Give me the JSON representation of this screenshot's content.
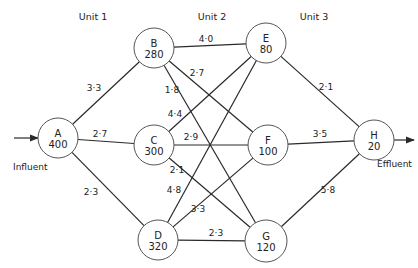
{
  "units": [
    {
      "label": "Unit 1",
      "x": 93,
      "y": 20
    },
    {
      "label": "Unit 2",
      "x": 212,
      "y": 20
    },
    {
      "label": "Unit 3",
      "x": 314,
      "y": 20
    }
  ],
  "nodes": [
    {
      "id": "A",
      "value": "400",
      "x": 58,
      "y": 138,
      "r": 20
    },
    {
      "id": "B",
      "value": "280",
      "x": 154,
      "y": 48,
      "r": 20
    },
    {
      "id": "C",
      "value": "300",
      "x": 154,
      "y": 145,
      "r": 20
    },
    {
      "id": "D",
      "value": "320",
      "x": 158,
      "y": 240,
      "r": 20
    },
    {
      "id": "E",
      "value": "80",
      "x": 266,
      "y": 43,
      "r": 20
    },
    {
      "id": "F",
      "value": "100",
      "x": 268,
      "y": 145,
      "r": 20
    },
    {
      "id": "G",
      "value": "120",
      "x": 266,
      "y": 241,
      "r": 21
    },
    {
      "id": "H",
      "value": "20",
      "x": 374,
      "y": 140,
      "r": 20
    }
  ],
  "edges": [
    {
      "from": "A",
      "to": "B",
      "label": "3·3",
      "lx": 94,
      "ly": 91
    },
    {
      "from": "A",
      "to": "C",
      "label": "2·7",
      "lx": 100,
      "ly": 137
    },
    {
      "from": "A",
      "to": "D",
      "label": "2·3",
      "lx": 91,
      "ly": 195
    },
    {
      "from": "B",
      "to": "E",
      "label": "4·0",
      "lx": 206,
      "ly": 42
    },
    {
      "from": "B",
      "to": "F",
      "label": "2·7",
      "lx": 197,
      "ly": 76
    },
    {
      "from": "B",
      "to": "G",
      "label": "1·8",
      "lx": 172,
      "ly": 93
    },
    {
      "from": "C",
      "to": "E",
      "label": "4·4",
      "lx": 175,
      "ly": 117
    },
    {
      "from": "C",
      "to": "F",
      "label": "2·9",
      "lx": 191,
      "ly": 140
    },
    {
      "from": "C",
      "to": "G",
      "label": "2·1",
      "lx": 177,
      "ly": 173
    },
    {
      "from": "D",
      "to": "E",
      "label": "4·8",
      "lx": 174,
      "ly": 193
    },
    {
      "from": "D",
      "to": "F",
      "label": "3·3",
      "lx": 198,
      "ly": 212
    },
    {
      "from": "D",
      "to": "G",
      "label": "2·3",
      "lx": 216,
      "ly": 236
    },
    {
      "from": "E",
      "to": "H",
      "label": "2·1",
      "lx": 326,
      "ly": 90
    },
    {
      "from": "F",
      "to": "H",
      "label": "3·5",
      "lx": 320,
      "ly": 137
    },
    {
      "from": "G",
      "to": "H",
      "label": "5·8",
      "lx": 328,
      "ly": 193
    }
  ],
  "influent": {
    "label": "Influent",
    "x": 13,
    "y": 170
  },
  "effluent": {
    "label": "Effluent",
    "x": 377,
    "y": 167
  },
  "colors": {
    "line": "#2a2a2a",
    "circle": "#555555",
    "text": "#222222",
    "background": "#ffffff"
  }
}
